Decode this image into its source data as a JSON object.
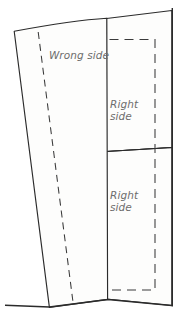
{
  "diagram": {
    "type": "line-drawing",
    "canvas": {
      "width": 183,
      "height": 327
    },
    "colors": {
      "background": "#ffffff",
      "stroke": "#2b2b2b",
      "dashed_stroke": "#3a3a3a",
      "panel_fill": "#fdfdfc",
      "label_text": "#6d6d6d"
    },
    "labels": {
      "wrong_side": "Wrong side",
      "right_side_upper": "Right\nside",
      "right_side_lower": "Right\nside"
    },
    "parts": {
      "tilted_panel": "tilted-front-panel",
      "upper_back_panel": "upper-back-panel",
      "lower_back_panel": "lower-back-panel",
      "fold_line": "dashed-fold-line",
      "seam_allowance_outline": "dashed-seam-outline",
      "ground_line": "ground-line",
      "right_edge_line": "right-edge-line",
      "panel_divider": "panel-divider-line"
    }
  }
}
